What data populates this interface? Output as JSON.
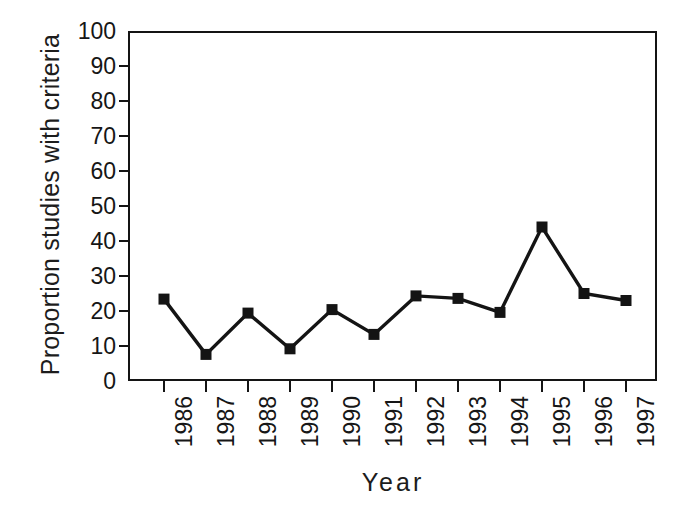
{
  "chart_data": {
    "type": "line",
    "title": "",
    "xlabel": "Year",
    "ylabel": "Proportion studies with criteria",
    "categories": [
      "1986",
      "1987",
      "1988",
      "1989",
      "1990",
      "1991",
      "1992",
      "1993",
      "1994",
      "1995",
      "1996",
      "1997"
    ],
    "values": [
      23.4,
      7.6,
      19.4,
      9.2,
      20.4,
      13.3,
      24.3,
      23.6,
      19.6,
      44.0,
      25.0,
      23.0
    ],
    "series": [
      {
        "name": "Proportion studies with criteria",
        "values": [
          23.4,
          7.6,
          19.4,
          9.2,
          20.4,
          13.3,
          24.3,
          23.6,
          19.6,
          44.0,
          25.0,
          23.0
        ]
      }
    ],
    "ylim": [
      0,
      100
    ],
    "yticks": [
      0,
      10,
      20,
      30,
      40,
      50,
      60,
      70,
      80,
      90,
      100
    ],
    "ytick_labels": [
      "0",
      "10",
      "20",
      "30",
      "40",
      "50",
      "60",
      "70",
      "80",
      "90",
      "100"
    ],
    "grid": false,
    "legend": false,
    "legend_position": "none",
    "marker": "square",
    "line_color": "#141414",
    "marker_color": "#141414",
    "background_color": "#ffffff",
    "axis_color": "#141414"
  },
  "axes": {
    "x_title": "Year",
    "y_title": "Proportion studies with criteria"
  }
}
